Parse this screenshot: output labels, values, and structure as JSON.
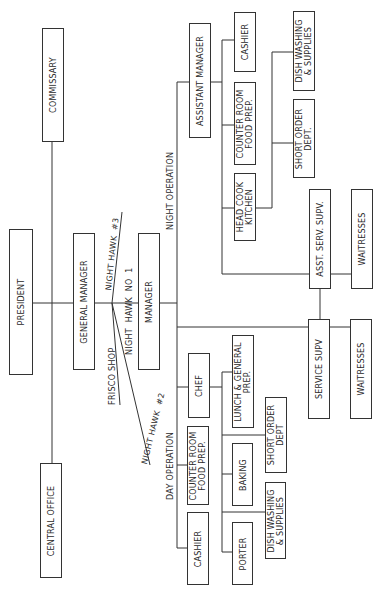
{
  "chart": {
    "type": "organization-chart",
    "orientation": "rotated -90deg",
    "nodes": {
      "president": "PRESIDENT",
      "commissary": "COMMISSARY",
      "central_office": "CENTRAL OFFICE",
      "general_manager": "GENERAL MANAGER",
      "manager": "MANAGER",
      "assistant_manager": "ASSISTANT MANAGER",
      "night_cashier": "CASHIER",
      "night_counter_room": "COUNTER ROOM\nFOOD PREP.",
      "head_cook": "HEAD COOK\nKITCHEN",
      "night_dish_washing": "DISH WASHING\n& SUPPLIES",
      "night_short_order": "SHORT ORDER\nDEPT.",
      "asst_serv_supv": "ASST. SERV. SUPV.",
      "night_waitresses": "WAITRESSES",
      "service_supv": "SERVICE SUPV",
      "day_waitresses": "WAITRESSES",
      "chef": "CHEF",
      "day_counter_room": "COUNTER ROOM\nFOOD PREP.",
      "day_cashier": "CASHIER",
      "lunch_general_prep": "LUNCH & GENERAL\nPREP.",
      "baking": "BAKING",
      "porter": "PORTER",
      "day_short_order": "SHORT ORDER\nDEPT",
      "day_dish_washing": "DISH WASHING\n& SUPPLIES"
    },
    "branch_labels": {
      "night_hawk_3": "NIGHT HAWK  #3",
      "night_hawk_1": "NIGHT  HAWK  NO  1",
      "frisco_shop": "FRISCO SHOP",
      "night_hawk_2": "NIGHT HAWK  #2",
      "night_operation": "NIGHT OPERATION",
      "day_operation": "DAY OPERATION"
    },
    "colors": {
      "line": "#333333",
      "text": "#2a2a2a",
      "background": "#ffffff"
    }
  }
}
